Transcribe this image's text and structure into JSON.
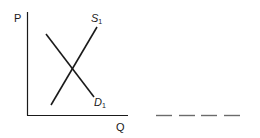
{
  "diagram": {
    "type": "supply-demand",
    "axes": {
      "y_label": "P",
      "x_label": "Q"
    },
    "curves": [
      {
        "name": "supply",
        "label": "S",
        "subscript": "1"
      },
      {
        "name": "demand",
        "label": "D",
        "subscript": "1"
      }
    ],
    "answer_blank": "_ _ _ _",
    "colors": {
      "line": "#1a1a1a",
      "blank": "#6b6b6b",
      "background": "#ffffff"
    }
  }
}
